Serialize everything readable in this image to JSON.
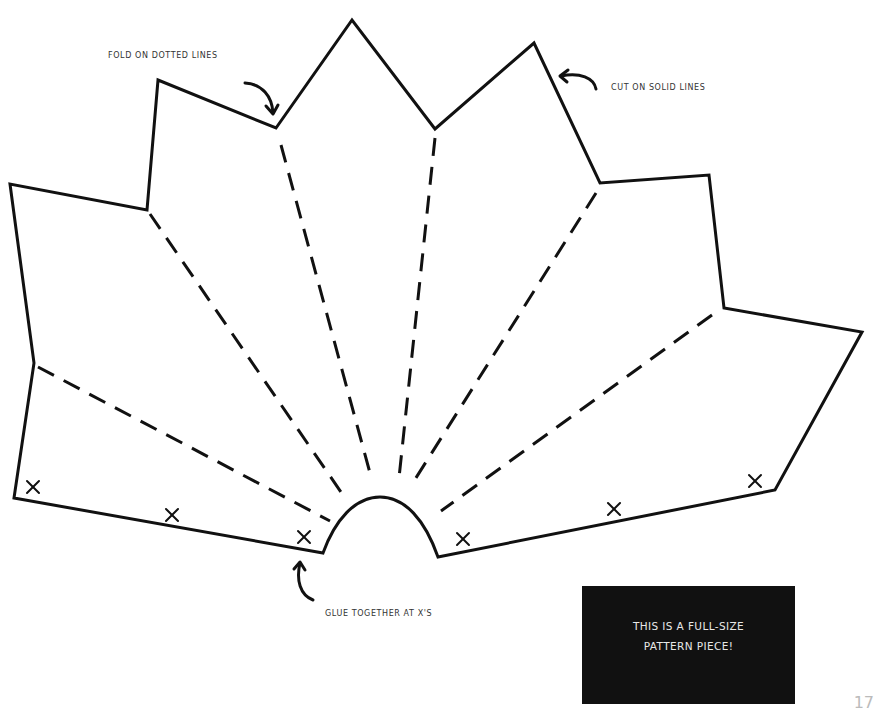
{
  "annotations": {
    "fold": "FOLD ON DOTTED LINES",
    "cut": "CUT ON SOLID LINES",
    "glue": "GLUE TOGETHER AT X'S"
  },
  "note": {
    "line1": "THIS IS A FULL-SIZE",
    "line2": "PATTERN PIECE!"
  },
  "page_number": "17",
  "pattern": {
    "glue_marks": 6,
    "fold_lines": 8,
    "stroke_color": "#111111"
  }
}
